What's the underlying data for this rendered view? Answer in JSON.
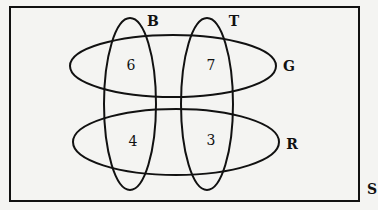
{
  "diagram": {
    "type": "venn",
    "universal_set": {
      "label": "S",
      "rect": {
        "x": 10,
        "y": 7,
        "width": 349,
        "height": 194
      }
    },
    "colors": {
      "background": "#f4f4f2",
      "stroke": "#111111",
      "text": "#111111"
    },
    "sets": [
      {
        "id": "B",
        "label": "B",
        "orientation": "vertical",
        "cx": 130,
        "cy": 104,
        "rx": 26,
        "ry": 86,
        "label_x": 153,
        "label_y": 26
      },
      {
        "id": "T",
        "label": "T",
        "orientation": "vertical",
        "cx": 207,
        "cy": 104,
        "rx": 26,
        "ry": 86,
        "label_x": 234,
        "label_y": 26
      },
      {
        "id": "G",
        "label": "G",
        "orientation": "horizontal",
        "cx": 173,
        "cy": 66,
        "rx": 103,
        "ry": 31,
        "label_x": 289,
        "label_y": 71
      },
      {
        "id": "R",
        "label": "R",
        "orientation": "horizontal",
        "cx": 176,
        "cy": 142,
        "rx": 103,
        "ry": 33,
        "label_x": 292,
        "label_y": 149
      }
    ],
    "regions": [
      {
        "sets": [
          "B",
          "G"
        ],
        "label": "B ∩ G",
        "value": "6",
        "x": 131,
        "y": 70
      },
      {
        "sets": [
          "T",
          "G"
        ],
        "label": "T ∩ G",
        "value": "7",
        "x": 211,
        "y": 70
      },
      {
        "sets": [
          "B",
          "R"
        ],
        "label": "B ∩ R",
        "value": "4",
        "x": 133,
        "y": 146
      },
      {
        "sets": [
          "T",
          "R"
        ],
        "label": "T ∩ R",
        "value": "3",
        "x": 211,
        "y": 145
      }
    ],
    "universal_label_pos": {
      "x": 372,
      "y": 194
    }
  }
}
